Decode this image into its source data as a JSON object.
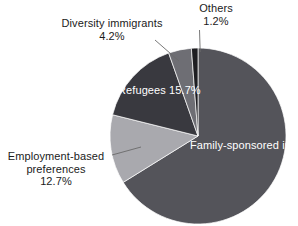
{
  "chart_data": {
    "type": "pie",
    "title": "",
    "subtitle": "",
    "xlabel": "",
    "ylabel": "",
    "legend_position": "none",
    "grid": false,
    "start_angle_deg": 0,
    "direction": "clockwise",
    "units": "percent",
    "categories": [
      "Family-sponsored immigrants",
      "Employment-based preferences",
      "Refugees",
      "Diversity immigrants",
      "Others"
    ],
    "values": [
      66.1,
      12.7,
      15.7,
      4.2,
      1.2
    ],
    "slices": [
      {
        "id": "family",
        "label": "Family-sponsored",
        "label_line2": "immigrants",
        "name": "Family-sponsored immigrants",
        "value": 66.1,
        "value_text": "66.1%",
        "color": "#54545a",
        "label_placement": "inside",
        "label_color": "#ffffff"
      },
      {
        "id": "employment",
        "label": "Employment-based",
        "label_line2": "preferences",
        "name": "Employment-based preferences",
        "value": 12.7,
        "value_text": "12.7%",
        "color": "#a9a9ae",
        "label_placement": "outside",
        "label_color": "#1b1b1b"
      },
      {
        "id": "refugees",
        "label": "Refugees",
        "label_line2": "",
        "name": "Refugees",
        "value": 15.7,
        "value_text": "15.7%",
        "color": "#39393f",
        "label_placement": "inside",
        "label_color": "#ffffff"
      },
      {
        "id": "diversity",
        "label": "Diversity immigrants",
        "label_line2": "",
        "name": "Diversity immigrants",
        "value": 4.2,
        "value_text": "4.2%",
        "color": "#6e6e74",
        "label_placement": "outside",
        "label_color": "#1b1b1b"
      },
      {
        "id": "others",
        "label": "Others",
        "label_line2": "",
        "name": "Others",
        "value": 1.2,
        "value_text": "1.2%",
        "color": "#1e1e22",
        "label_placement": "outside",
        "label_color": "#1b1b1b"
      }
    ],
    "colors": {
      "family_sponsored": "#54545a",
      "employment_based": "#a9a9ae",
      "refugees": "#39393f",
      "diversity": "#6e6e74",
      "others": "#1e1e22",
      "background": "#ffffff",
      "leader_line": "#6a6a6a",
      "text": "#1b1b1b",
      "inside_text": "#ffffff"
    }
  }
}
